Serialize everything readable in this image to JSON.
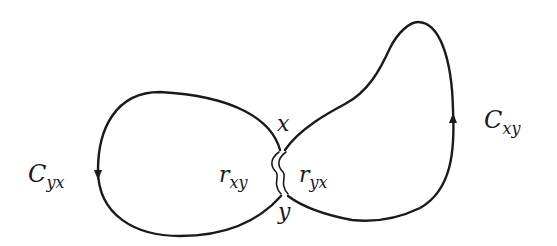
{
  "diagram": {
    "loops": [
      {
        "id": "left",
        "label": {
          "main": "C",
          "sub": "yx"
        },
        "arrow_direction": "down"
      },
      {
        "id": "right",
        "label": {
          "main": "C",
          "sub": "xy"
        },
        "arrow_direction": "up"
      }
    ],
    "points": {
      "x": "x",
      "y": "y"
    },
    "arcs": [
      {
        "id": "r_xy",
        "label": {
          "main": "r",
          "sub": "xy"
        }
      },
      {
        "id": "r_yx",
        "label": {
          "main": "r",
          "sub": "yx"
        }
      }
    ],
    "colors": {
      "stroke": "#1a1a1a",
      "background": "#ffffff"
    }
  }
}
